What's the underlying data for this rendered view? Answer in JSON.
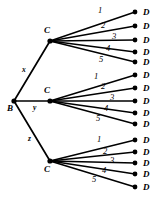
{
  "diagram": {
    "type": "tree",
    "title": "",
    "background_color": "#ffffff",
    "line_color": "#000000",
    "root": {
      "id": "B",
      "label": "B",
      "x": 14,
      "y": 101
    },
    "branches": [
      {
        "edge_label": "x",
        "edge_label_x": 22,
        "edge_label_y": 72,
        "node": {
          "id": "C1",
          "label": "C",
          "x": 50,
          "y": 41,
          "label_x": 44,
          "label_y": 33
        },
        "leaves": [
          {
            "label": "D",
            "edge_label": "1",
            "dot_x": 135,
            "dot_y": 12,
            "label_x": 143,
            "label_y": 15,
            "num_x": 98,
            "num_y": 13
          },
          {
            "label": "D",
            "edge_label": "2",
            "dot_x": 135,
            "dot_y": 26,
            "label_x": 143,
            "label_y": 29,
            "num_x": 101,
            "num_y": 28
          },
          {
            "label": "D",
            "edge_label": "3",
            "dot_x": 135,
            "dot_y": 40,
            "label_x": 143,
            "label_y": 43,
            "num_x": 112,
            "num_y": 39
          },
          {
            "label": "D",
            "edge_label": "4",
            "dot_x": 135,
            "dot_y": 52,
            "label_x": 143,
            "label_y": 55,
            "num_x": 106,
            "num_y": 51
          },
          {
            "label": "D",
            "edge_label": "5",
            "dot_x": 135,
            "dot_y": 62,
            "label_x": 143,
            "label_y": 65,
            "num_x": 99,
            "num_y": 62
          }
        ]
      },
      {
        "edge_label": "y",
        "edge_label_x": 33,
        "edge_label_y": 110,
        "node": {
          "id": "C2",
          "label": "C",
          "x": 50,
          "y": 101,
          "label_x": 44,
          "label_y": 93
        },
        "leaves": [
          {
            "label": "D",
            "edge_label": "1",
            "dot_x": 135,
            "dot_y": 75,
            "label_x": 143,
            "label_y": 78,
            "num_x": 94,
            "num_y": 79
          },
          {
            "label": "D",
            "edge_label": "2",
            "dot_x": 135,
            "dot_y": 88,
            "label_x": 143,
            "label_y": 91,
            "num_x": 101,
            "num_y": 89
          },
          {
            "label": "D",
            "edge_label": "3",
            "dot_x": 135,
            "dot_y": 101,
            "label_x": 143,
            "label_y": 104,
            "num_x": 110,
            "num_y": 100
          },
          {
            "label": "D",
            "edge_label": "4",
            "dot_x": 135,
            "dot_y": 113,
            "label_x": 143,
            "label_y": 116,
            "num_x": 104,
            "num_y": 111
          },
          {
            "label": "D",
            "edge_label": "5",
            "dot_x": 135,
            "dot_y": 124,
            "label_x": 143,
            "label_y": 127,
            "num_x": 96,
            "num_y": 121
          }
        ]
      },
      {
        "edge_label": "z",
        "edge_label_x": 28,
        "edge_label_y": 141,
        "node": {
          "id": "C3",
          "label": "C",
          "x": 50,
          "y": 161,
          "label_x": 44,
          "label_y": 172
        },
        "leaves": [
          {
            "label": "D",
            "edge_label": "1",
            "dot_x": 135,
            "dot_y": 140,
            "label_x": 143,
            "label_y": 143,
            "num_x": 97,
            "num_y": 142
          },
          {
            "label": "D",
            "edge_label": "2",
            "dot_x": 135,
            "dot_y": 152,
            "label_x": 143,
            "label_y": 155,
            "num_x": 103,
            "num_y": 154
          },
          {
            "label": "D",
            "edge_label": "3",
            "dot_x": 135,
            "dot_y": 163,
            "label_x": 143,
            "label_y": 166,
            "num_x": 110,
            "num_y": 163
          },
          {
            "label": "D",
            "edge_label": "4",
            "dot_x": 135,
            "dot_y": 174,
            "label_x": 143,
            "label_y": 177,
            "num_x": 102,
            "num_y": 173
          },
          {
            "label": "D",
            "edge_label": "5",
            "dot_x": 135,
            "dot_y": 187,
            "label_x": 143,
            "label_y": 190,
            "num_x": 92,
            "num_y": 182
          }
        ]
      }
    ]
  }
}
